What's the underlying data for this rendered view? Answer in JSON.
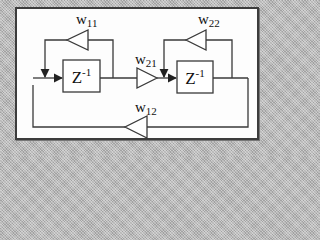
{
  "diagram": {
    "type": "signal-flow / recurrent network",
    "colors": {
      "line": "#3a3a3a",
      "panel": "#fdfdfd",
      "frame": "#b8b8b8"
    },
    "delay_blocks": [
      {
        "id": "z1",
        "label": "Z",
        "exponent": "-1"
      },
      {
        "id": "z2",
        "label": "Z",
        "exponent": "-1"
      }
    ],
    "gains": [
      {
        "id": "w11",
        "base": "w",
        "sub": "11",
        "direction": "left"
      },
      {
        "id": "w21",
        "base": "w",
        "sub": "21",
        "direction": "right"
      },
      {
        "id": "w22",
        "base": "w",
        "sub": "22",
        "direction": "left"
      },
      {
        "id": "w12",
        "base": "w",
        "sub": "12",
        "direction": "left"
      }
    ],
    "edges": [
      "z1 -> w21 -> z2",
      "z1 output -> w11 -> z1 input (self loop)",
      "z2 output -> w22 -> z2 input (self loop)",
      "z2 output -> w12 -> z1 input (feedback)"
    ]
  }
}
